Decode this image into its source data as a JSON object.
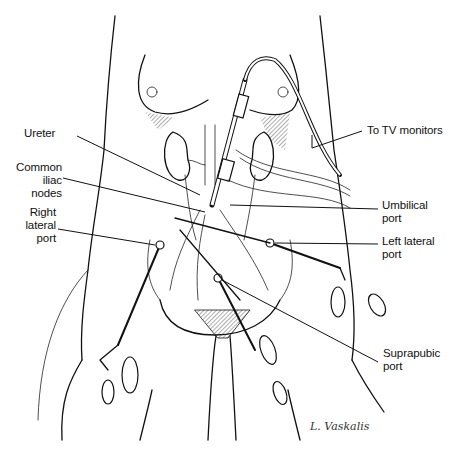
{
  "figure": {
    "labels": {
      "ureter": "Ureter",
      "common_iliac_1": "Common",
      "common_iliac_2": "iliac",
      "common_iliac_3": "nodes",
      "right_lateral_1": "Right",
      "right_lateral_2": "lateral",
      "right_lateral_3": "port",
      "tv_monitors": "To TV monitors",
      "umbilical_1": "Umbilical",
      "umbilical_2": "port",
      "left_lateral_1": "Left lateral",
      "left_lateral_2": "port",
      "suprapubic_1": "Suprapubic",
      "suprapubic_2": "port"
    },
    "signature": "L. Vaskalis",
    "colors": {
      "ink": "#111111",
      "background": "#ffffff"
    }
  }
}
